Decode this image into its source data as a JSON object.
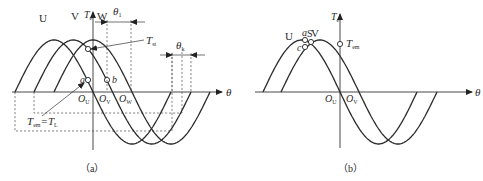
{
  "figures": [
    {
      "id": "a",
      "caption": "（a）",
      "axis": {
        "y": 92,
        "x_start": 12,
        "x_end": 222,
        "label": "θ",
        "label_x": 226
      },
      "vertical_axis": {
        "x": 93,
        "y_top": 12,
        "y_bottom": 150,
        "label": "T",
        "label_sub": "e"
      },
      "amplitude": 52,
      "half_period": 78,
      "curves": [
        {
          "name": "U",
          "x_start": 15,
          "x_end": 171,
          "label_x": 39,
          "label_y": 22
        },
        {
          "name": "V",
          "x_start": 34,
          "x_end": 191,
          "label_x": 71,
          "label_y": 20
        },
        {
          "name": "W",
          "x_start": 54,
          "x_end": 210,
          "label_x": 97,
          "label_y": 20
        }
      ],
      "zero_labels": [
        {
          "text": "O",
          "sub": "U",
          "x": 78,
          "y": 102
        },
        {
          "text": "O",
          "sub": "V",
          "x": 99,
          "y": 102
        },
        {
          "text": "O",
          "sub": "W",
          "x": 119,
          "y": 102
        }
      ],
      "points": [
        {
          "label": "a",
          "x": 88,
          "y": 80,
          "label_x": 80,
          "label_y": 83
        },
        {
          "label": "b",
          "x": 107,
          "y": 80,
          "label_x": 112,
          "label_y": 83
        },
        {
          "label": "",
          "x": 88,
          "y": 49
        }
      ],
      "annotations": {
        "Tst": {
          "text": "T",
          "sub": "st",
          "x": 146,
          "y": 44,
          "lead_from": [
            144,
            40
          ],
          "lead_to": [
            91,
            49
          ]
        },
        "Tem_TL": {
          "text": "T",
          "sub1": "em",
          "eq": "=T",
          "sub2": "L",
          "x": 27,
          "y": 125,
          "lead_from": [
            42,
            116
          ],
          "lead_to": [
            84,
            83
          ]
        },
        "theta1": {
          "text": "θ",
          "sub": "1",
          "x": 113,
          "y": 15,
          "line_y": 22,
          "x1": 107,
          "x2": 131
        },
        "thetak": {
          "text": "θ",
          "sub": "k",
          "x": 176,
          "y": 49,
          "line_y": 55,
          "x1": 172,
          "x2": 191
        }
      },
      "dashed_boxes": [
        {
          "x1": 34,
          "x2": 182,
          "y": 113
        },
        {
          "x1": 15,
          "x2": 172,
          "y": 131
        }
      ]
    },
    {
      "id": "b",
      "caption": "（b）",
      "axis": {
        "y": 92,
        "x_start": 255,
        "x_end": 472,
        "label": "θ",
        "label_x": 475
      },
      "vertical_axis": {
        "x": 340,
        "y_top": 14,
        "y_bottom": 148,
        "label": "T",
        "label_sub": "e"
      },
      "amplitude": 52,
      "half_period": 77,
      "curves": [
        {
          "name": "U",
          "x_start": 263,
          "x_end": 417,
          "label_x": 285,
          "label_y": 40
        },
        {
          "name": "V",
          "x_start": 281,
          "x_end": 437,
          "label_x": 311,
          "label_y": 37
        }
      ],
      "zero_labels": [
        {
          "text": "O",
          "sub": "U",
          "x": 325,
          "y": 102
        },
        {
          "text": "O",
          "sub": "V",
          "x": 346,
          "y": 102
        }
      ],
      "points": [
        {
          "label": "a",
          "x": 305,
          "y": 40,
          "label_x": 302,
          "label_y": 36
        },
        {
          "label": "S",
          "x": 311,
          "y": 42,
          "label_x": 307,
          "label_y": 37
        },
        {
          "label": "c",
          "x": 305,
          "y": 47,
          "label_x": 297,
          "label_y": 51
        },
        {
          "label": "",
          "x": 340,
          "y": 44
        }
      ],
      "annotations": {
        "Tem": {
          "text": "T",
          "sub": "em",
          "x": 346,
          "y": 47
        }
      }
    }
  ]
}
